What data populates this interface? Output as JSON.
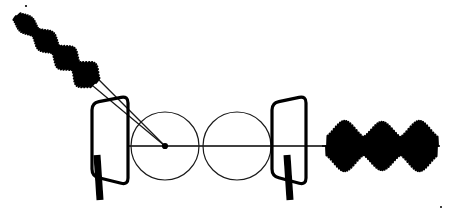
{
  "figure": {
    "background_color": "#ffffff",
    "ink_color": "#000000",
    "thin_line_color": "#1a1a1a",
    "width": 451,
    "height": 214,
    "axis": {
      "label": "optical-axis",
      "y": 146,
      "x_start": 128,
      "x_end": 332,
      "stroke_width": 1.6
    }
  },
  "input_beam": {
    "label": "incident-chirped-wave-packet",
    "description": "Diagonal train of modulated oscillation bursts travelling down-right toward the first plate",
    "start_x": 16,
    "start_y": 16,
    "end_x": 96,
    "end_y": 83,
    "angle_degrees": 40,
    "packet_count": 4,
    "cycles_total": 46,
    "max_half_amplitude": 15,
    "min_half_amplitude": 3,
    "stroke_width": 2.0,
    "envelope_peaks": [
      0.62,
      0.78,
      0.9,
      1.0
    ]
  },
  "rays": {
    "label": "converging-ray-pair",
    "count": 2,
    "origin_x": 95,
    "origin_y": 82,
    "target_x": 165,
    "target_y": 146,
    "spread_px": 7,
    "stroke_width": 1.3
  },
  "plates": [
    {
      "label": "entrance-plate",
      "name": "left-plate",
      "top_left_x": 92,
      "top_left_y": 103,
      "top_right_x": 128,
      "top_right_y": 96,
      "bottom_right_x": 128,
      "bottom_right_y": 185,
      "bottom_left_x": 92,
      "bottom_left_y": 176,
      "corner_radius": 7,
      "stroke_width": 3.2,
      "stem": {
        "label": "left-plate-stem",
        "x": 97,
        "y_top": 155,
        "y_bottom": 200,
        "width": 7,
        "lean": 3
      }
    },
    {
      "label": "exit-plate",
      "name": "right-plate",
      "top_left_x": 272,
      "top_left_y": 103,
      "top_right_x": 306,
      "top_right_y": 96,
      "bottom_right_x": 306,
      "bottom_right_y": 185,
      "bottom_left_x": 272,
      "bottom_left_y": 176,
      "corner_radius": 7,
      "stroke_width": 3.2,
      "stem": {
        "label": "right-plate-stem",
        "x": 287,
        "y_top": 155,
        "y_bottom": 200,
        "width": 7,
        "lean": 3
      }
    }
  ],
  "lenses": [
    {
      "label": "first-lens-circle",
      "name": "circle-left",
      "cx": 165,
      "cy": 146,
      "r": 34,
      "stroke_width": 1.2
    },
    {
      "label": "second-lens-circle",
      "name": "circle-right",
      "cx": 237,
      "cy": 146,
      "r": 34,
      "stroke_width": 1.2
    }
  ],
  "focal_point": {
    "label": "focal-spot",
    "cx": 165,
    "cy": 146,
    "r": 3.1
  },
  "output_beam": {
    "label": "output-wave-packet-train",
    "description": "Three amplitude-modulated bursts emerging along the optical axis",
    "baseline_y": 146,
    "start_x": 326,
    "end_x": 438,
    "packet_count": 3,
    "cycles_total": 54,
    "max_half_amplitude": 26,
    "min_half_amplitude": 4,
    "stroke_width": 1.9,
    "envelope_peaks": [
      1.0,
      0.96,
      1.0
    ]
  },
  "specks": [
    {
      "label": "ink-speck-top",
      "cx": 26,
      "cy": 6,
      "r": 1.1
    },
    {
      "label": "ink-speck-bottom-right",
      "cx": 441,
      "cy": 207,
      "r": 1.0
    }
  ]
}
